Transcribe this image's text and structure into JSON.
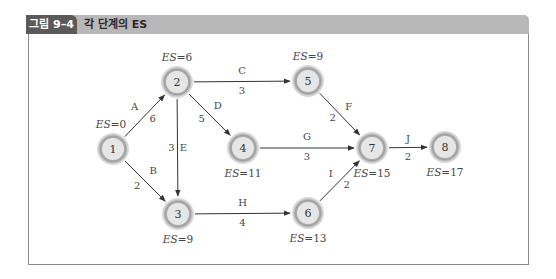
{
  "header": {
    "figure_label": "그림 9–4",
    "title": "각 단계의 ES"
  },
  "colors": {
    "label_bg": "#5a5a5a",
    "bar_bg": "#b8b8b8",
    "node_fill": "#e6e6e6",
    "node_ring": "#9a9a9a",
    "edge": "#333333",
    "frame": "#8a8a8a"
  },
  "nodes": [
    {
      "id": "1",
      "label": "1",
      "x": 113,
      "y": 149,
      "es": "ES=0",
      "es_pos": "above-left"
    },
    {
      "id": "2",
      "label": "2",
      "x": 177,
      "y": 82,
      "es": "ES=6",
      "es_pos": "above"
    },
    {
      "id": "3",
      "label": "3",
      "x": 178,
      "y": 214,
      "es": "ES=9",
      "es_pos": "below"
    },
    {
      "id": "4",
      "label": "4",
      "x": 243,
      "y": 148,
      "es": "ES=11",
      "es_pos": "below"
    },
    {
      "id": "5",
      "label": "5",
      "x": 308,
      "y": 81,
      "es": "ES=9",
      "es_pos": "above"
    },
    {
      "id": "6",
      "label": "6",
      "x": 308,
      "y": 213,
      "es": "ES=13",
      "es_pos": "below"
    },
    {
      "id": "7",
      "label": "7",
      "x": 372,
      "y": 148,
      "es": "ES=15",
      "es_pos": "below"
    },
    {
      "id": "8",
      "label": "8",
      "x": 445,
      "y": 147,
      "es": "ES=17",
      "es_pos": "below"
    }
  ],
  "edges": [
    {
      "from": "1",
      "to": "2",
      "activity": "A",
      "duration": "6"
    },
    {
      "from": "1",
      "to": "3",
      "activity": "B",
      "duration": "2"
    },
    {
      "from": "2",
      "to": "5",
      "activity": "C",
      "duration": "3"
    },
    {
      "from": "2",
      "to": "4",
      "activity": "D",
      "duration": "5"
    },
    {
      "from": "2",
      "to": "3",
      "activity": "E",
      "duration": "3"
    },
    {
      "from": "5",
      "to": "7",
      "activity": "F",
      "duration": "2"
    },
    {
      "from": "4",
      "to": "7",
      "activity": "G",
      "duration": "3"
    },
    {
      "from": "3",
      "to": "6",
      "activity": "H",
      "duration": "4"
    },
    {
      "from": "6",
      "to": "7",
      "activity": "I",
      "duration": "2"
    },
    {
      "from": "7",
      "to": "8",
      "activity": "J",
      "duration": "2"
    }
  ]
}
